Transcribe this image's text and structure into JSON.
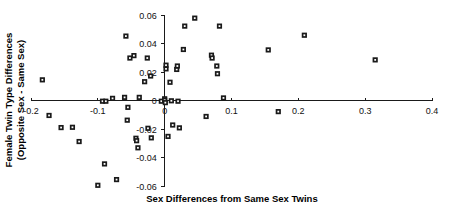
{
  "chart_data": {
    "type": "scatter",
    "title": "",
    "xlabel": "Sex Differences from Same Sex Twins",
    "ylabel": "Female Twin Type Differences (Opposite Sex - Same Sex)",
    "ylabel_line1": "Female Twin Type Differences",
    "ylabel_line2": "(Opposite Sex - Same Sex)",
    "xlim": [
      -0.2,
      0.4
    ],
    "ylim": [
      -0.06,
      0.06
    ],
    "xticks": [
      -0.2,
      -0.1,
      0,
      0.1,
      0.2,
      0.3,
      0.4
    ],
    "xticklabels": [
      "-0.2",
      "-0.1",
      "0",
      "0.1",
      "0.2",
      "0.3",
      "0.4"
    ],
    "yticks": [
      0.06,
      0.04,
      0.02,
      0,
      -0.02,
      -0.04,
      -0.06
    ],
    "yticklabels": [
      "0.06",
      "0.04",
      "0.02",
      "0",
      "-0.02",
      "-0.04",
      "-0.06"
    ],
    "grid": false,
    "legend": null,
    "marker": "filled-square",
    "marker_color": "#1a1a1a",
    "points": [
      {
        "x": -0.183,
        "y": 0.0145
      },
      {
        "x": -0.173,
        "y": -0.0105
      },
      {
        "x": -0.155,
        "y": -0.019
      },
      {
        "x": -0.138,
        "y": -0.0188
      },
      {
        "x": -0.128,
        "y": -0.0288
      },
      {
        "x": -0.1,
        "y": -0.0595
      },
      {
        "x": -0.093,
        "y": -0.0005
      },
      {
        "x": -0.09,
        "y": -0.0445
      },
      {
        "x": -0.088,
        "y": -0.0005
      },
      {
        "x": -0.078,
        "y": 0.0015
      },
      {
        "x": -0.072,
        "y": -0.0555
      },
      {
        "x": -0.06,
        "y": 0.0022
      },
      {
        "x": -0.058,
        "y": 0.0452
      },
      {
        "x": -0.056,
        "y": -0.0138
      },
      {
        "x": -0.055,
        "y": -0.0048
      },
      {
        "x": -0.052,
        "y": 0.0298
      },
      {
        "x": -0.046,
        "y": 0.0315
      },
      {
        "x": -0.043,
        "y": -0.0265
      },
      {
        "x": -0.042,
        "y": -0.0282
      },
      {
        "x": -0.04,
        "y": -0.0332
      },
      {
        "x": -0.038,
        "y": 0.0022
      },
      {
        "x": -0.03,
        "y": 0.0132
      },
      {
        "x": -0.026,
        "y": 0.0298
      },
      {
        "x": -0.025,
        "y": -0.0195
      },
      {
        "x": -0.021,
        "y": 0.0172
      },
      {
        "x": -0.02,
        "y": -0.0262
      },
      {
        "x": -0.005,
        "y": -0.0005
      },
      {
        "x": 0.0,
        "y": 0.0012
      },
      {
        "x": 0.0,
        "y": 0.0002
      },
      {
        "x": 0.001,
        "y": -0.0015
      },
      {
        "x": 0.002,
        "y": 0.0222
      },
      {
        "x": 0.002,
        "y": 0.0248
      },
      {
        "x": 0.005,
        "y": -0.0252
      },
      {
        "x": 0.008,
        "y": 0.0128
      },
      {
        "x": 0.01,
        "y": -0.0002
      },
      {
        "x": 0.012,
        "y": -0.0172
      },
      {
        "x": 0.018,
        "y": 0.0218
      },
      {
        "x": 0.019,
        "y": 0.0242
      },
      {
        "x": 0.02,
        "y": -0.0005
      },
      {
        "x": 0.022,
        "y": -0.0192
      },
      {
        "x": 0.028,
        "y": 0.0358
      },
      {
        "x": 0.03,
        "y": 0.0522
      },
      {
        "x": 0.045,
        "y": 0.0578
      },
      {
        "x": 0.062,
        "y": -0.0112
      },
      {
        "x": 0.07,
        "y": 0.0318
      },
      {
        "x": 0.071,
        "y": 0.0298
      },
      {
        "x": 0.078,
        "y": 0.0242
      },
      {
        "x": 0.079,
        "y": 0.0188
      },
      {
        "x": 0.082,
        "y": 0.0522
      },
      {
        "x": 0.088,
        "y": 0.0018
      },
      {
        "x": 0.155,
        "y": 0.0355
      },
      {
        "x": 0.17,
        "y": -0.0078
      },
      {
        "x": 0.209,
        "y": 0.0458
      },
      {
        "x": 0.315,
        "y": 0.0285
      }
    ]
  }
}
